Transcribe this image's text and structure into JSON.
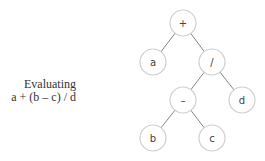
{
  "caption": {
    "line1": "Evaluating",
    "line2": "a + (b – c) / d"
  },
  "tree": {
    "nodes": [
      {
        "id": "plus",
        "label": "+",
        "x": 183,
        "y": 23
      },
      {
        "id": "a",
        "label": "a",
        "x": 153,
        "y": 62
      },
      {
        "id": "div",
        "label": "/",
        "x": 212,
        "y": 62
      },
      {
        "id": "minus",
        "label": "–",
        "x": 183,
        "y": 100
      },
      {
        "id": "d",
        "label": "d",
        "x": 242,
        "y": 100
      },
      {
        "id": "b",
        "label": "b",
        "x": 153,
        "y": 138
      },
      {
        "id": "c",
        "label": "c",
        "x": 212,
        "y": 138
      }
    ],
    "edges": [
      [
        "plus",
        "a"
      ],
      [
        "plus",
        "div"
      ],
      [
        "div",
        "minus"
      ],
      [
        "div",
        "d"
      ],
      [
        "minus",
        "b"
      ],
      [
        "minus",
        "c"
      ]
    ]
  }
}
